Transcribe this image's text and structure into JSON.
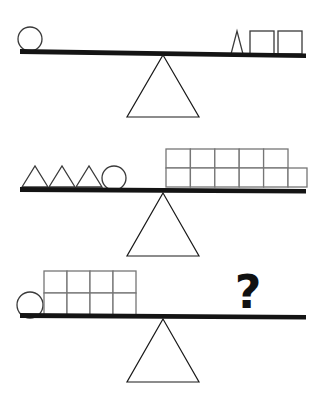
{
  "puzzle": {
    "title": "Balance scale weight puzzle",
    "background_color": "#ffffff",
    "beam_color": "#141414",
    "outline_color": "#3a3a3a",
    "grid_outline_color": "#767676",
    "unknown_symbol": "?",
    "scales": [
      {
        "id": "scale-1",
        "name": "balance-scale-1",
        "tilt": "left-up",
        "left_pan": {
          "name": "left-pan-1",
          "items": [
            {
              "shape": "circle",
              "count": 1
            }
          ]
        },
        "right_pan": {
          "name": "right-pan-1",
          "items": [
            {
              "shape": "triangle",
              "count": 1
            },
            {
              "shape": "square",
              "count": 2
            }
          ]
        }
      },
      {
        "id": "scale-2",
        "name": "balance-scale-2",
        "tilt": "left-up",
        "left_pan": {
          "name": "left-pan-2",
          "items": [
            {
              "shape": "triangle",
              "count": 3
            },
            {
              "shape": "circle",
              "count": 1
            }
          ]
        },
        "right_pan": {
          "name": "right-pan-2",
          "items": [
            {
              "shape": "square-grid",
              "rows": 2,
              "top_row": 5,
              "bottom_row": 6,
              "count": 11
            }
          ]
        }
      },
      {
        "id": "scale-3",
        "name": "balance-scale-3",
        "tilt": "left-up",
        "left_pan": {
          "name": "left-pan-3",
          "items": [
            {
              "shape": "circle",
              "count": 1
            },
            {
              "shape": "square-grid",
              "rows": 2,
              "top_row": 4,
              "bottom_row": 4,
              "count": 8
            }
          ]
        },
        "right_pan": {
          "name": "right-pan-3",
          "items": [
            {
              "shape": "question-mark",
              "count": 1
            }
          ]
        }
      }
    ]
  }
}
